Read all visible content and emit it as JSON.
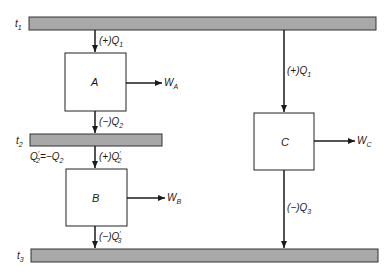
{
  "reservoirs": [
    {
      "id": "t1",
      "label": "t",
      "sub": "1"
    },
    {
      "id": "t2",
      "label": "t",
      "sub": "2"
    },
    {
      "id": "t3",
      "label": "t",
      "sub": "3"
    }
  ],
  "engines": [
    {
      "id": "A",
      "label": "A",
      "work": "W",
      "work_sub": "A"
    },
    {
      "id": "B",
      "label": "B",
      "work": "W",
      "work_sub": "B"
    },
    {
      "id": "C",
      "label": "C",
      "work": "W",
      "work_sub": "C"
    }
  ],
  "flows": {
    "a_in": {
      "prefix": "(+)Q",
      "sub": "1",
      "prime": ""
    },
    "a_out": {
      "prefix": "(−)Q",
      "sub": "2",
      "prime": ""
    },
    "b_in": {
      "prefix": "(+)Q",
      "sub": "2",
      "prime": "′"
    },
    "b_out": {
      "prefix": "(−)Q",
      "sub": "3",
      "prime": "′"
    },
    "c_in": {
      "prefix": "(+)Q",
      "sub": "1",
      "prime": ""
    },
    "c_out": {
      "prefix": "(−)Q",
      "sub": "3",
      "prime": ""
    }
  },
  "relation": {
    "lhs": "Q",
    "lhs_sub": "2",
    "lhs_prime": "′",
    "mid": "=−Q",
    "rhs_sub": "2"
  }
}
